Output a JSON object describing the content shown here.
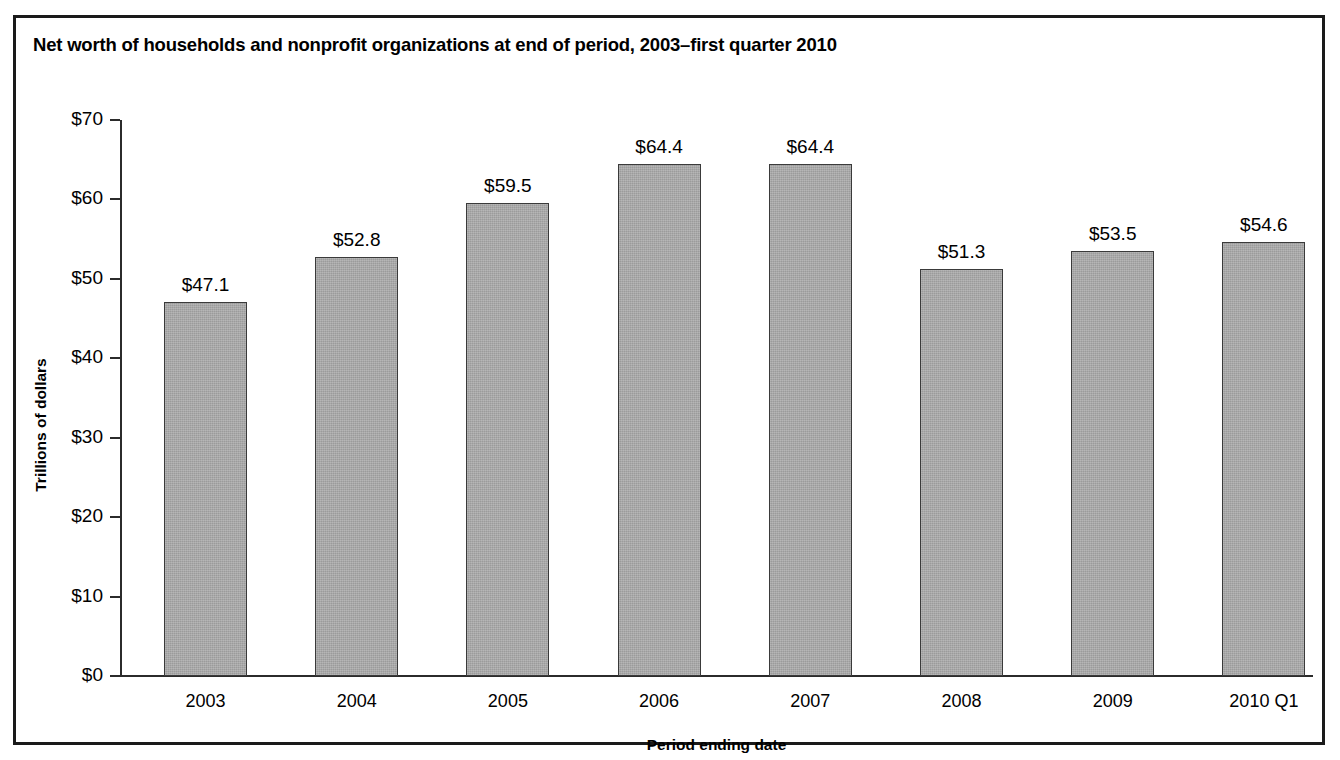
{
  "figure": {
    "title": "Net worth of households and nonprofit organizations at end of period, 2003–first quarter 2010",
    "frame_color": "#1a1a1a",
    "background": "#ffffff"
  },
  "chart_data": {
    "type": "bar",
    "title": "Net worth of households and nonprofit organizations at end of period, 2003–first quarter 2010",
    "xlabel": "Period ending date",
    "ylabel": "Trillions of dollars",
    "categories": [
      "2003",
      "2004",
      "2005",
      "2006",
      "2007",
      "2008",
      "2009",
      "2010 Q1"
    ],
    "values": [
      47.1,
      52.8,
      59.5,
      64.4,
      64.4,
      51.3,
      53.5,
      54.6
    ],
    "value_labels": [
      "$47.1",
      "$52.8",
      "$59.5",
      "$64.4",
      "$64.4",
      "$51.3",
      "$53.5",
      "$54.6"
    ],
    "ylim": [
      0,
      70
    ],
    "ytick_values": [
      0,
      10,
      20,
      30,
      40,
      50,
      60,
      70
    ],
    "ytick_labels": [
      "$0",
      "$10",
      "$20",
      "$30",
      "$40",
      "$50",
      "$60",
      "$70"
    ],
    "grid": false,
    "legend": false,
    "bar_color": "#a6a6a6",
    "bar_edge_color": "#3a3a3a",
    "axis_color": "#2b2b2b"
  }
}
